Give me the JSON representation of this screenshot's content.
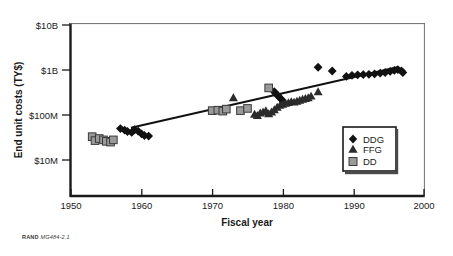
{
  "figure": {
    "source_note_brand": "RAND",
    "source_note_id": "MG484-2.1"
  },
  "chart_data": {
    "type": "scatter",
    "title": "",
    "xlabel": "Fiscal year",
    "ylabel": "End unit costs (TY$)",
    "xlim": [
      1950,
      2000
    ],
    "ylim": [
      10000000,
      10000000000
    ],
    "yscale": "log",
    "grid": false,
    "xticks": [
      1950,
      1960,
      1970,
      1980,
      1990,
      2000
    ],
    "xtick_labels": [
      "1950",
      "1960",
      "1970",
      "1980",
      "1990",
      "2000"
    ],
    "yticks": [
      10000000,
      100000000,
      1000000000,
      10000000000
    ],
    "ytick_labels": [
      "$10M",
      "$100M",
      "$1B",
      "$10B"
    ],
    "legend_position": "lower right",
    "legend_entries": [
      {
        "name": "DDG",
        "marker": "diamond",
        "color": "#111111"
      },
      {
        "name": "FFG",
        "marker": "triangle",
        "color": "#2b2b2b"
      },
      {
        "name": "DD",
        "marker": "square",
        "color": "#9a9a9a"
      }
    ],
    "series": [
      {
        "name": "DDG",
        "marker": "diamond",
        "color": "#111111",
        "points": [
          [
            1957,
            50000000
          ],
          [
            1957.6,
            46000000
          ],
          [
            1958,
            43000000
          ],
          [
            1958.6,
            41000000
          ],
          [
            1959,
            47000000
          ],
          [
            1959.5,
            44000000
          ],
          [
            1960,
            38000000
          ],
          [
            1960.4,
            35000000
          ],
          [
            1961,
            34000000
          ],
          [
            1978.8,
            330000000
          ],
          [
            1979,
            300000000
          ],
          [
            1979.3,
            270000000
          ],
          [
            1979.6,
            240000000
          ],
          [
            1979.9,
            215000000
          ],
          [
            1985,
            1150000000
          ],
          [
            1987,
            950000000
          ],
          [
            1989,
            720000000
          ],
          [
            1989.8,
            760000000
          ],
          [
            1990.6,
            780000000
          ],
          [
            1991.4,
            790000000
          ],
          [
            1992.2,
            800000000
          ],
          [
            1993,
            820000000
          ],
          [
            1993.8,
            850000000
          ],
          [
            1994.5,
            880000000
          ],
          [
            1995.2,
            930000000
          ],
          [
            1995.8,
            980000000
          ],
          [
            1996.3,
            1020000000
          ],
          [
            1996.8,
            960000000
          ],
          [
            1997,
            880000000
          ]
        ]
      },
      {
        "name": "FFG",
        "marker": "triangle",
        "color": "#2b2b2b",
        "points": [
          [
            1973,
            245000000
          ],
          [
            1976,
            105000000
          ],
          [
            1976.4,
            98000000
          ],
          [
            1976.8,
            112000000
          ],
          [
            1977.2,
            118000000
          ],
          [
            1977.6,
            125000000
          ],
          [
            1978,
            108000000
          ],
          [
            1978.4,
            118000000
          ],
          [
            1978.8,
            132000000
          ],
          [
            1979.2,
            150000000
          ],
          [
            1979.6,
            165000000
          ],
          [
            1980,
            175000000
          ],
          [
            1980.4,
            185000000
          ],
          [
            1980.8,
            190000000
          ],
          [
            1981.2,
            200000000
          ],
          [
            1981.6,
            195000000
          ],
          [
            1982,
            205000000
          ],
          [
            1982.4,
            215000000
          ],
          [
            1982.8,
            225000000
          ],
          [
            1983.2,
            235000000
          ],
          [
            1983.6,
            245000000
          ],
          [
            1984,
            265000000
          ],
          [
            1985,
            330000000
          ]
        ]
      },
      {
        "name": "DD",
        "marker": "square",
        "color": "#9a9a9a",
        "points": [
          [
            1953,
            33000000
          ],
          [
            1953.4,
            27000000
          ],
          [
            1954,
            30000000
          ],
          [
            1954.6,
            28000000
          ],
          [
            1955,
            26000000
          ],
          [
            1955.6,
            25000000
          ],
          [
            1956,
            28000000
          ],
          [
            1970,
            125000000
          ],
          [
            1970.8,
            128000000
          ],
          [
            1971.5,
            122000000
          ],
          [
            1972,
            135000000
          ],
          [
            1974,
            125000000
          ],
          [
            1975,
            140000000
          ],
          [
            1978,
            400000000
          ]
        ]
      }
    ],
    "trendline": {
      "name": "fit",
      "color": "#111111",
      "points": [
        [
          1958.5,
          52000000
        ],
        [
          1996.2,
          1150000000
        ]
      ]
    }
  }
}
